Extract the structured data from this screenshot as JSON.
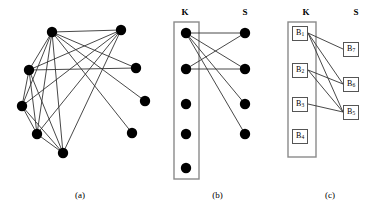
{
  "figure": {
    "panels": [
      {
        "id": "a",
        "caption": "(a)",
        "description": "undirected graph with 9 vertices drawn as filled black circles"
      },
      {
        "id": "b",
        "caption": "(b)",
        "left_column_label": "K",
        "right_column_label": "S",
        "description": "bipartite-style drawing, left vertices enclosed in a rectangle"
      },
      {
        "id": "c",
        "caption": "(c)",
        "left_column_label": "K",
        "right_column_label": "S",
        "description": "block graph with labelled square nodes"
      }
    ]
  },
  "chart_data": {
    "type": "diagram",
    "title": "",
    "panels": [
      {
        "id": "a",
        "type": "graph",
        "nodes": [
          {
            "id": "a1",
            "x": 52,
            "y": 32
          },
          {
            "id": "a2",
            "x": 121,
            "y": 30
          },
          {
            "id": "a3",
            "x": 29,
            "y": 70
          },
          {
            "id": "a4",
            "x": 136,
            "y": 68
          },
          {
            "id": "a5",
            "x": 22,
            "y": 106
          },
          {
            "id": "a6",
            "x": 145,
            "y": 101
          },
          {
            "id": "a7",
            "x": 37,
            "y": 134
          },
          {
            "id": "a8",
            "x": 132,
            "y": 133
          },
          {
            "id": "a9",
            "x": 63,
            "y": 153
          }
        ],
        "edges": [
          [
            "a1",
            "a2"
          ],
          [
            "a1",
            "a3"
          ],
          [
            "a1",
            "a4"
          ],
          [
            "a1",
            "a5"
          ],
          [
            "a1",
            "a6"
          ],
          [
            "a1",
            "a7"
          ],
          [
            "a1",
            "a8"
          ],
          [
            "a1",
            "a9"
          ],
          [
            "a3",
            "a4"
          ],
          [
            "a3",
            "a5"
          ],
          [
            "a3",
            "a7"
          ],
          [
            "a3",
            "a9"
          ],
          [
            "a2",
            "a5"
          ],
          [
            "a2",
            "a7"
          ],
          [
            "a2",
            "a9"
          ],
          [
            "a5",
            "a7"
          ],
          [
            "a5",
            "a9"
          ],
          [
            "a7",
            "a9"
          ],
          [
            "a3",
            "a2"
          ]
        ]
      },
      {
        "id": "b",
        "type": "bipartite-graph",
        "left_label": "K",
        "right_label": "S",
        "left_nodes": [
          {
            "id": "k1",
            "x": 26,
            "y": 33
          },
          {
            "id": "k2",
            "x": 26,
            "y": 69
          },
          {
            "id": "k3",
            "x": 26,
            "y": 104
          },
          {
            "id": "k4",
            "x": 26,
            "y": 134
          },
          {
            "id": "k5",
            "x": 26,
            "y": 168
          }
        ],
        "right_nodes": [
          {
            "id": "s1",
            "x": 85,
            "y": 33
          },
          {
            "id": "s2",
            "x": 85,
            "y": 69
          },
          {
            "id": "s3",
            "x": 85,
            "y": 104
          },
          {
            "id": "s4",
            "x": 85,
            "y": 134
          }
        ],
        "edges": [
          [
            "k1",
            "s1"
          ],
          [
            "k1",
            "s2"
          ],
          [
            "k1",
            "s3"
          ],
          [
            "k1",
            "s4"
          ],
          [
            "k2",
            "s1"
          ],
          [
            "k2",
            "s2"
          ]
        ],
        "enclosure": {
          "x": 14,
          "y": 22,
          "width": 25,
          "height": 157
        }
      },
      {
        "id": "c",
        "type": "block-graph",
        "left_label": "K",
        "right_label": "S",
        "left_nodes": [
          {
            "id": "cb1",
            "label": "B",
            "sub": "1",
            "x": 25,
            "y": 33
          },
          {
            "id": "cb2",
            "label": "B",
            "sub": "2",
            "x": 25,
            "y": 70
          },
          {
            "id": "cb3",
            "label": "B",
            "sub": "3",
            "x": 25,
            "y": 104
          },
          {
            "id": "cb4",
            "label": "B",
            "sub": "4",
            "x": 25,
            "y": 136
          }
        ],
        "right_nodes": [
          {
            "id": "cb7",
            "label": "B",
            "sub": "7",
            "x": 76,
            "y": 49
          },
          {
            "id": "cb6",
            "label": "B",
            "sub": "6",
            "x": 76,
            "y": 84
          },
          {
            "id": "cb5",
            "label": "B",
            "sub": "5",
            "x": 76,
            "y": 112
          }
        ],
        "edges": [
          [
            "cb1",
            "cb7"
          ],
          [
            "cb1",
            "cb6"
          ],
          [
            "cb1",
            "cb5"
          ],
          [
            "cb2",
            "cb6"
          ],
          [
            "cb2",
            "cb5"
          ],
          [
            "cb3",
            "cb5"
          ]
        ],
        "enclosure": {
          "x": 13,
          "y": 22,
          "width": 28,
          "height": 135
        }
      }
    ],
    "style": {
      "node_color": "#000000",
      "edge_color": "#333333",
      "box_border_color": "#555555",
      "background": "#ffffff"
    }
  }
}
